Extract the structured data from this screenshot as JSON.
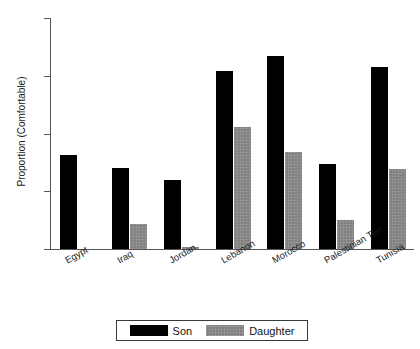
{
  "chart_data": {
    "type": "bar",
    "title": "",
    "xlabel": "",
    "ylabel": "Proportion (Comfortable)",
    "categories": [
      "Egypt",
      "Iraq",
      "Jordan",
      "Lebanon",
      "Morocco",
      "Palestinian Terr.",
      "Tunisia"
    ],
    "series": [
      {
        "name": "Son",
        "color": "#000000",
        "values": [
          0.163,
          0.14,
          0.119,
          0.308,
          0.335,
          0.148,
          0.315
        ]
      },
      {
        "name": "Daughter",
        "color": "#808080",
        "values": [
          0.0,
          0.044,
          0.003,
          0.212,
          0.168,
          0.05,
          0.138
        ]
      }
    ],
    "ylim": [
      0,
      0.4
    ],
    "yticks": [
      0,
      0.1,
      0.2,
      0.3,
      0.4
    ],
    "ytick_labels": [
      "0",
      ".1",
      ".2",
      ".3",
      ".4"
    ],
    "grid": false,
    "legend_position": "bottom"
  }
}
